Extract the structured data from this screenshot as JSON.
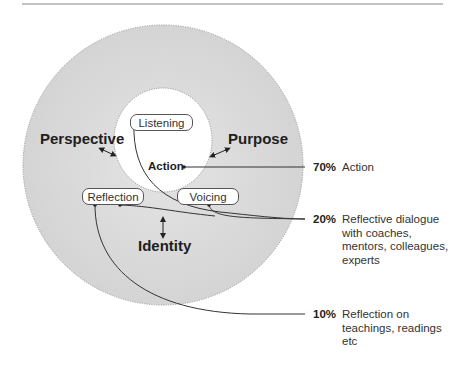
{
  "diagram": {
    "outer_ring": {
      "labels": {
        "perspective": "Perspective",
        "purpose": "Purpose",
        "identity": "Identity"
      }
    },
    "inner": {
      "center_label": "Action",
      "nodes": {
        "listening": "Listening",
        "reflection": "Reflection",
        "voicing": "Voicing"
      }
    },
    "legend": [
      {
        "percent": "70%",
        "text": "Action"
      },
      {
        "percent": "20%",
        "text": "Reflective dialogue\nwith coaches,\nmentors, colleagues,\nexperts"
      },
      {
        "percent": "10%",
        "text": "Reflection on\nteachings, readings\netc"
      }
    ],
    "colors": {
      "outer_fill": "#dcdcdc",
      "inner_fill": "#ffffff",
      "line": "#333333",
      "rule": "#888888"
    }
  }
}
